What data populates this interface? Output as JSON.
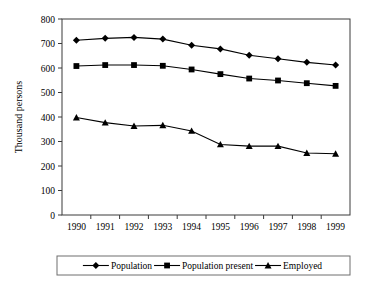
{
  "chart_data": {
    "type": "line",
    "title": "",
    "xlabel": "",
    "ylabel": "Thousand persons",
    "categories": [
      "1990",
      "1991",
      "1992",
      "1993",
      "1994",
      "1995",
      "1996",
      "1997",
      "1998",
      "1999"
    ],
    "x": [
      1990,
      1991,
      1992,
      1993,
      1994,
      1995,
      1996,
      1997,
      1998,
      1999
    ],
    "ylim": [
      0,
      800
    ],
    "ytick_step": 100,
    "yticks": [
      "0",
      "100",
      "200",
      "300",
      "400",
      "500",
      "600",
      "700",
      "800"
    ],
    "grid": false,
    "legend_position": "bottom",
    "series": [
      {
        "name": "Population",
        "marker": "diamond",
        "values": [
          713,
          721,
          725,
          718,
          693,
          678,
          652,
          638,
          623,
          612
        ]
      },
      {
        "name": "Population present",
        "marker": "square",
        "values": [
          608,
          612,
          612,
          609,
          594,
          575,
          557,
          549,
          538,
          527
        ]
      },
      {
        "name": "Employed",
        "marker": "triangle",
        "values": [
          398,
          377,
          363,
          366,
          343,
          288,
          281,
          281,
          253,
          250
        ]
      }
    ]
  },
  "axis": {
    "y_title": "Thousand persons"
  },
  "legend": {
    "entries": [
      {
        "label": "Population",
        "marker": "diamond-marker"
      },
      {
        "label": "Population present",
        "marker": "square-marker"
      },
      {
        "label": "Employed",
        "marker": "triangle-marker"
      }
    ]
  },
  "colors": {
    "series": "#000000",
    "frame": "#3a3a3a",
    "background": "#ffffff",
    "legend_border": "#6e6e6e"
  }
}
